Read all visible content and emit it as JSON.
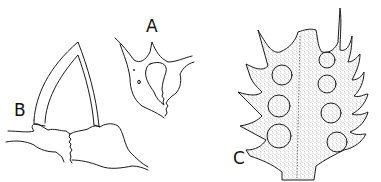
{
  "figure": {
    "panels": [
      {
        "label": "A",
        "description": "junction of branches with tooth and fractured area"
      },
      {
        "label": "B",
        "description": "arched structure on fractured base"
      },
      {
        "label": "C",
        "description": "stippled leaf-like lamina with spine-tipped lobes and circular perforations"
      }
    ],
    "colors": {
      "ink": "#1a1a1a",
      "background": "#ffffff",
      "stipple": "#555555"
    }
  }
}
